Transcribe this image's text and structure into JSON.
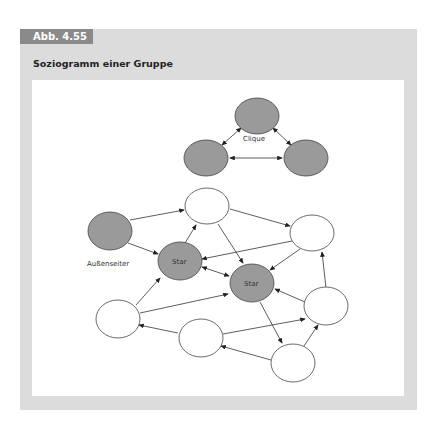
{
  "figure": {
    "tag": "Abb. 4.55",
    "title": "Soziogramm einer Gruppe"
  },
  "colors": {
    "frame": "#dcdcdc",
    "tag": "#8a8a8a",
    "gray_node": "#9a9a9a",
    "white_node": "#ffffff",
    "edge": "#333333"
  },
  "labels": {
    "clique": "Clique",
    "outsider": "Außenseiter",
    "star1": "Star",
    "star2": "Star"
  },
  "nodes": [
    {
      "id": "c_top",
      "x": 257,
      "y": 116,
      "fill": "gray"
    },
    {
      "id": "c_left",
      "x": 206,
      "y": 158,
      "fill": "gray"
    },
    {
      "id": "c_right",
      "x": 306,
      "y": 158,
      "fill": "gray"
    },
    {
      "id": "outsider",
      "x": 110,
      "y": 231,
      "fill": "gray",
      "label": "Außenseiter"
    },
    {
      "id": "top",
      "x": 207,
      "y": 206,
      "fill": "white"
    },
    {
      "id": "right",
      "x": 312,
      "y": 233,
      "fill": "white"
    },
    {
      "id": "star1",
      "x": 180,
      "y": 261,
      "fill": "gray",
      "label": "Star"
    },
    {
      "id": "star2",
      "x": 252,
      "y": 283,
      "fill": "gray",
      "label": "Star"
    },
    {
      "id": "left_low",
      "x": 118,
      "y": 319,
      "fill": "white"
    },
    {
      "id": "mid_low",
      "x": 201,
      "y": 338,
      "fill": "white"
    },
    {
      "id": "right_low",
      "x": 326,
      "y": 306,
      "fill": "white"
    },
    {
      "id": "bottom",
      "x": 293,
      "y": 363,
      "fill": "white"
    }
  ]
}
